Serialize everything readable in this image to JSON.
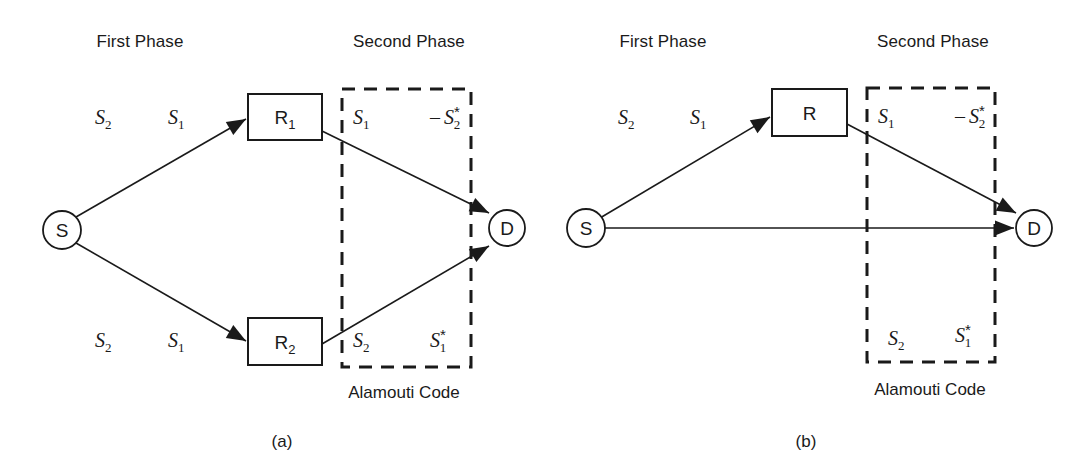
{
  "figure": {
    "type": "diagram",
    "background_color": "#ffffff",
    "stroke_color": "#1a1a1a",
    "panels": [
      {
        "id": "a",
        "caption": "(a)",
        "caption_x": 282,
        "caption_y": 447,
        "phase_labels": [
          {
            "name": "first-phase",
            "text": "First Phase",
            "x": 140,
            "y": 47
          },
          {
            "name": "second-phase",
            "text": "Second Phase",
            "x": 409,
            "y": 47
          }
        ],
        "nodes": [
          {
            "name": "source-node",
            "shape": "circle",
            "label": "S",
            "cx": 62,
            "cy": 230,
            "r": 19
          },
          {
            "name": "relay-node-r1",
            "shape": "rect",
            "label": "R",
            "sub": "1",
            "x": 248,
            "y": 94,
            "w": 74,
            "h": 46
          },
          {
            "name": "relay-node-r2",
            "shape": "rect",
            "label": "R",
            "sub": "2",
            "x": 248,
            "y": 318,
            "w": 74,
            "h": 47
          },
          {
            "name": "destination-node",
            "shape": "circle",
            "label": "D",
            "cx": 507,
            "cy": 228,
            "r": 18
          }
        ],
        "edges": [
          {
            "name": "edge-source-to-r1",
            "x1": 76,
            "y1": 217,
            "x2": 246,
            "y2": 119
          },
          {
            "name": "edge-source-to-r2",
            "x1": 76,
            "y1": 243,
            "x2": 246,
            "y2": 341
          },
          {
            "name": "edge-r1-to-destination",
            "x1": 322,
            "y1": 131,
            "x2": 489,
            "y2": 213
          },
          {
            "name": "edge-r2-to-destination",
            "x1": 322,
            "y1": 344,
            "x2": 489,
            "y2": 246
          }
        ],
        "alamouti_box": {
          "name": "alamouti-code-box",
          "x": 342,
          "y": 89,
          "w": 129,
          "h": 278
        },
        "alamouti_caption": {
          "name": "alamouti-code-caption",
          "text": "Alamouti Code",
          "x": 404,
          "y": 398
        },
        "symbols": [
          {
            "name": "symbol-s2-first-phase-top",
            "base": "S",
            "sub": "2",
            "star": false,
            "minus": false,
            "x": 95,
            "y": 124
          },
          {
            "name": "symbol-s1-first-phase-top",
            "base": "S",
            "sub": "1",
            "star": false,
            "minus": false,
            "x": 168,
            "y": 124
          },
          {
            "name": "symbol-s2-first-phase-bottom",
            "base": "S",
            "sub": "2",
            "star": false,
            "minus": false,
            "x": 95,
            "y": 347
          },
          {
            "name": "symbol-s1-first-phase-bottom",
            "base": "S",
            "sub": "1",
            "star": false,
            "minus": false,
            "x": 168,
            "y": 347
          },
          {
            "name": "symbol-s1-second-phase-r1",
            "base": "S",
            "sub": "1",
            "star": false,
            "minus": false,
            "x": 353,
            "y": 124
          },
          {
            "name": "symbol-minus-s2-star",
            "base": "S",
            "sub": "2",
            "star": true,
            "minus": true,
            "x": 430,
            "y": 124
          },
          {
            "name": "symbol-s2-second-phase-r2",
            "base": "S",
            "sub": "2",
            "star": false,
            "minus": false,
            "x": 353,
            "y": 347
          },
          {
            "name": "symbol-s1-star",
            "base": "S",
            "sub": "1",
            "star": true,
            "minus": false,
            "x": 430,
            "y": 347
          }
        ]
      },
      {
        "id": "b",
        "caption": "(b)",
        "caption_x": 806,
        "caption_y": 447,
        "phase_labels": [
          {
            "name": "first-phase",
            "text": "First Phase",
            "x": 663,
            "y": 47
          },
          {
            "name": "second-phase",
            "text": "Second Phase",
            "x": 933,
            "y": 47
          }
        ],
        "nodes": [
          {
            "name": "source-node",
            "shape": "circle",
            "label": "S",
            "cx": 586,
            "cy": 228,
            "r": 19
          },
          {
            "name": "relay-node-r",
            "shape": "rect",
            "label": "R",
            "sub": "",
            "x": 772,
            "y": 89,
            "w": 75,
            "h": 47
          },
          {
            "name": "destination-node",
            "shape": "circle",
            "label": "D",
            "cx": 1034,
            "cy": 228,
            "r": 18
          }
        ],
        "edges": [
          {
            "name": "edge-source-to-relay",
            "x1": 600,
            "y1": 218,
            "x2": 770,
            "y2": 117
          },
          {
            "name": "edge-source-to-destination",
            "x1": 605,
            "y1": 228,
            "x2": 1014,
            "y2": 228
          },
          {
            "name": "edge-relay-to-destination",
            "x1": 847,
            "y1": 124,
            "x2": 1016,
            "y2": 213
          }
        ],
        "alamouti_box": {
          "name": "alamouti-code-box",
          "x": 867,
          "y": 88,
          "w": 128,
          "h": 274
        },
        "alamouti_caption": {
          "name": "alamouti-code-caption",
          "text": "Alamouti Code",
          "x": 930,
          "y": 395
        },
        "symbols": [
          {
            "name": "symbol-s2-first-phase",
            "base": "S",
            "sub": "2",
            "star": false,
            "minus": false,
            "x": 618,
            "y": 124
          },
          {
            "name": "symbol-s1-first-phase",
            "base": "S",
            "sub": "1",
            "star": false,
            "minus": false,
            "x": 690,
            "y": 124
          },
          {
            "name": "symbol-s1-second-phase",
            "base": "S",
            "sub": "1",
            "star": false,
            "minus": false,
            "x": 878,
            "y": 123
          },
          {
            "name": "symbol-minus-s2-star",
            "base": "S",
            "sub": "2",
            "star": true,
            "minus": true,
            "x": 955,
            "y": 123
          },
          {
            "name": "symbol-s2-second-phase",
            "base": "S",
            "sub": "2",
            "star": false,
            "minus": false,
            "x": 888,
            "y": 345
          },
          {
            "name": "symbol-s1-star",
            "base": "S",
            "sub": "1",
            "star": true,
            "minus": false,
            "x": 955,
            "y": 342
          }
        ]
      }
    ]
  }
}
